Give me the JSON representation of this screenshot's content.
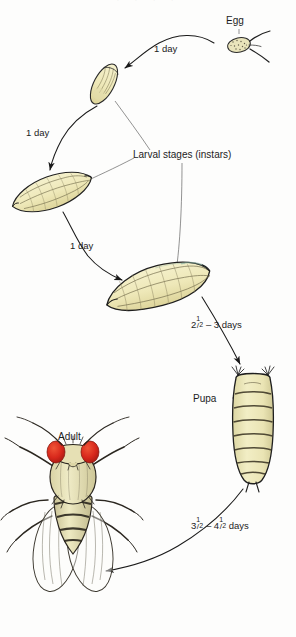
{
  "figure": {
    "background_color": "#fdfdfc",
    "top_cut_text": "· · · ·"
  },
  "labels": {
    "egg": "Egg",
    "larval_stages": "Larval stages (instars)",
    "pupa": "Pupa",
    "adult": "Adult"
  },
  "transitions": [
    {
      "id": "egg-to-first-instar",
      "text": "1 day"
    },
    {
      "id": "first-to-second-instar",
      "text": "1 day"
    },
    {
      "id": "second-to-third-instar",
      "text": "1 day"
    },
    {
      "id": "third-instar-to-pupa",
      "whole": "2",
      "frac_num": "1",
      "frac_den": "2",
      "tail": " – 3 days"
    },
    {
      "id": "pupa-to-adult",
      "whole": "3",
      "frac_num": "1",
      "frac_den": "2",
      "tail": " – 4",
      "whole2": "4",
      "frac2_num": "1",
      "frac2_den": "2",
      "tail2": " days"
    }
  ],
  "colors": {
    "ink": "#1a1a1a",
    "larva_body": "#efeac0",
    "larva_shade": "#ddd49a",
    "pupa_body": "#eeeabc",
    "egg_body": "#e9e4bb",
    "fly_body": "#e6e0b4",
    "fly_eye": "#d8281c",
    "fly_dark": "#3a352c",
    "wing": "rgba(255,255,255,0.18)",
    "teal_tint": "#7fa79b"
  },
  "stages": [
    {
      "name": "egg",
      "cx": 239,
      "cy": 44
    },
    {
      "name": "first-instar-larva",
      "cx": 104,
      "cy": 84
    },
    {
      "name": "second-instar-larva",
      "cx": 52,
      "cy": 192
    },
    {
      "name": "third-instar-larva",
      "cx": 158,
      "cy": 287
    },
    {
      "name": "pupa",
      "cx": 253,
      "cy": 424
    },
    {
      "name": "adult-fly",
      "cx": 72,
      "cy": 533
    }
  ]
}
